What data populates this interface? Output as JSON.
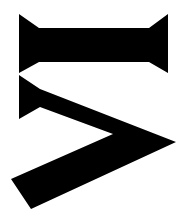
{
  "glyph": {
    "description": "rotated stylized glyph shapes",
    "fill_color": "#000000",
    "background_color": "#ffffff"
  }
}
